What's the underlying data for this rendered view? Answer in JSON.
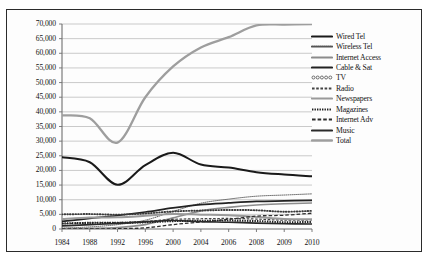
{
  "chart_data": {
    "type": "line",
    "title": "",
    "xlabel": "",
    "ylabel": "",
    "x": [
      "1984",
      "1988",
      "1992",
      "1996",
      "2000",
      "2004",
      "2006",
      "2008",
      "2009",
      "2010"
    ],
    "ylim": [
      0,
      70000
    ],
    "ytick_step": 5000,
    "yticks": [
      "0",
      "5,000",
      "10,000",
      "15,000",
      "20,000",
      "25,000",
      "30,000",
      "35,000",
      "40,000",
      "45,000",
      "50,000",
      "55,000",
      "60,000",
      "65,000",
      "70,000"
    ],
    "grid": true,
    "legend_position": "right",
    "series": [
      {
        "name": "Wired Tel",
        "style": "solid-thick-black",
        "color": "#1a1a1a",
        "values": [
          24500,
          22800,
          15100,
          21800,
          26000,
          22000,
          21000,
          19400,
          18600,
          18000
        ]
      },
      {
        "name": "Wireless Tel",
        "style": "fine-dotted",
        "color": "#555555",
        "values": [
          300,
          700,
          1500,
          3000,
          6000,
          8800,
          10200,
          11200,
          11600,
          12000
        ]
      },
      {
        "name": "Internet Access",
        "style": "solid-gray",
        "color": "#8c8c8c",
        "values": [
          100,
          200,
          500,
          1500,
          3800,
          6200,
          7400,
          8200,
          8600,
          8900
        ]
      },
      {
        "name": "Cable & Sat",
        "style": "solid-black",
        "color": "#222222",
        "values": [
          2600,
          3600,
          4600,
          5800,
          7200,
          8300,
          8900,
          9400,
          9600,
          9800
        ]
      },
      {
        "name": "TV",
        "style": "circle-chain",
        "color": "#3a3a3a",
        "values": [
          5000,
          5100,
          4900,
          5300,
          6000,
          6300,
          6500,
          6400,
          5900,
          6200
        ]
      },
      {
        "name": "Radio",
        "style": "dashed",
        "color": "#444444",
        "values": [
          1800,
          2100,
          2200,
          2600,
          3300,
          3500,
          3600,
          3400,
          3000,
          3100
        ]
      },
      {
        "name": "Newspapers",
        "style": "solid-gray-thick",
        "color": "#9a9a9a",
        "values": [
          3400,
          3900,
          4000,
          4500,
          5100,
          4900,
          4700,
          4100,
          3400,
          3300
        ]
      },
      {
        "name": "Magazines",
        "style": "square-dotted",
        "color": "#1f1f1f",
        "values": [
          1900,
          2100,
          2100,
          2300,
          2700,
          2800,
          2900,
          2700,
          2300,
          2400
        ]
      },
      {
        "name": "Internet Adv",
        "style": "long-dashed",
        "color": "#2e2e2e",
        "values": [
          0,
          0,
          100,
          400,
          1500,
          2400,
          3300,
          4400,
          4700,
          5400
        ]
      },
      {
        "name": "Music",
        "style": "solid-dark",
        "color": "#2a2a2a",
        "values": [
          1100,
          1500,
          1900,
          2400,
          2900,
          2500,
          2300,
          2000,
          1800,
          1700
        ]
      },
      {
        "name": "Total",
        "style": "solid-gray-wide",
        "color": "#9e9e9e",
        "values": [
          38800,
          37800,
          29500,
          45000,
          55500,
          62000,
          65500,
          69500,
          69800,
          70000
        ]
      }
    ]
  }
}
